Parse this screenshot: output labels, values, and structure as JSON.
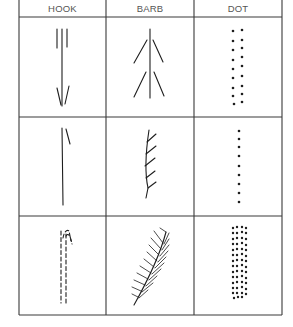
{
  "diagram": {
    "type": "table-of-stroke-symbols",
    "colors": {
      "line": "#3a3a3a",
      "ink": "#1e1e1e",
      "header_text": "#555555"
    },
    "columns": [
      {
        "label": "HOOK"
      },
      {
        "label": "BARB"
      },
      {
        "label": "DOT"
      }
    ],
    "rows": [
      {
        "hook": "triple-stroke-with-arrowhead",
        "barb": "double-chevron-barb",
        "dot": "double-column-dots"
      },
      {
        "hook": "single-stroke-with-hook",
        "barb": "curved-stem-with-side-barbs",
        "dot": "single-column-dots"
      },
      {
        "hook": "dashed-double-stroke-with-hooks",
        "barb": "feather-frond",
        "dot": "dense-dot-block"
      }
    ]
  }
}
